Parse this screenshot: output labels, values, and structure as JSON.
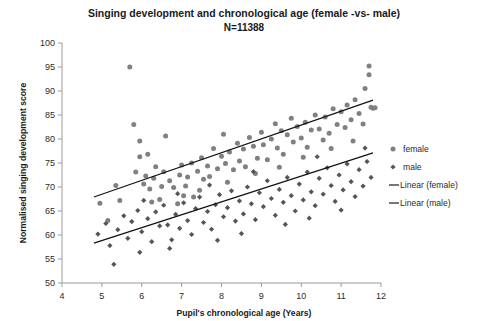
{
  "chart_data": {
    "type": "scatter",
    "title": "Singing development and chronological age (female -vs- male)",
    "subtitle": "N=11388",
    "xlabel": "Pupil's chronological age (Years)",
    "ylabel": "Normalised singing development score",
    "xlim": [
      4,
      12
    ],
    "ylim": [
      50,
      100
    ],
    "xticks": [
      4,
      5,
      6,
      7,
      8,
      9,
      10,
      11,
      12
    ],
    "yticks": [
      50,
      55,
      60,
      65,
      70,
      75,
      80,
      85,
      90,
      95,
      100
    ],
    "grid": false,
    "legend_position": "right",
    "marker_color": "#808080",
    "line_color": "#111111",
    "legend": [
      {
        "label": "female",
        "kind": "marker",
        "shape": "circle",
        "color": "#808080"
      },
      {
        "label": "male",
        "kind": "marker",
        "shape": "diamond",
        "color": "#555555"
      },
      {
        "label": "Linear (female)",
        "kind": "line",
        "color": "#111111"
      },
      {
        "label": "Linear (male)",
        "kind": "line",
        "color": "#111111"
      }
    ],
    "series": [
      {
        "name": "female",
        "shape": "circle",
        "color": "#808080",
        "points": [
          [
            4.95,
            66.6
          ],
          [
            5.15,
            63.0
          ],
          [
            5.35,
            70.3
          ],
          [
            5.45,
            67.2
          ],
          [
            5.7,
            95.0
          ],
          [
            5.8,
            83.0
          ],
          [
            5.95,
            79.6
          ],
          [
            5.95,
            76.3
          ],
          [
            6.05,
            70.6
          ],
          [
            6.1,
            72.3
          ],
          [
            6.2,
            69.6
          ],
          [
            6.3,
            71.8
          ],
          [
            6.35,
            74.2
          ],
          [
            6.45,
            67.4
          ],
          [
            6.5,
            70.1
          ],
          [
            6.55,
            73.2
          ],
          [
            6.6,
            80.6
          ],
          [
            6.7,
            71.3
          ],
          [
            6.8,
            69.9
          ],
          [
            6.95,
            72.5
          ],
          [
            7.0,
            74.6
          ],
          [
            7.1,
            70.2
          ],
          [
            7.15,
            72.1
          ],
          [
            7.25,
            75.0
          ],
          [
            7.3,
            67.9
          ],
          [
            7.4,
            73.3
          ],
          [
            7.5,
            76.1
          ],
          [
            7.55,
            71.6
          ],
          [
            7.65,
            74.4
          ],
          [
            7.7,
            72.2
          ],
          [
            7.8,
            78.0
          ],
          [
            7.9,
            73.8
          ],
          [
            8.0,
            76.4
          ],
          [
            8.05,
            81.0
          ],
          [
            8.1,
            74.9
          ],
          [
            8.2,
            77.3
          ],
          [
            8.3,
            73.6
          ],
          [
            8.4,
            79.1
          ],
          [
            8.45,
            75.4
          ],
          [
            8.55,
            77.9
          ],
          [
            8.6,
            74.2
          ],
          [
            8.7,
            80.3
          ],
          [
            8.8,
            78.5
          ],
          [
            8.9,
            76.0
          ],
          [
            9.0,
            81.4
          ],
          [
            9.05,
            78.8
          ],
          [
            9.15,
            75.7
          ],
          [
            9.25,
            80.0
          ],
          [
            9.35,
            83.2
          ],
          [
            9.4,
            78.1
          ],
          [
            9.5,
            81.7
          ],
          [
            9.55,
            76.8
          ],
          [
            9.65,
            80.9
          ],
          [
            9.75,
            84.3
          ],
          [
            9.8,
            79.4
          ],
          [
            9.9,
            82.6
          ],
          [
            10.0,
            80.2
          ],
          [
            10.1,
            83.5
          ],
          [
            10.15,
            78.3
          ],
          [
            10.25,
            81.9
          ],
          [
            10.35,
            85.0
          ],
          [
            10.45,
            82.1
          ],
          [
            10.55,
            79.8
          ],
          [
            10.6,
            84.6
          ],
          [
            10.7,
            81.2
          ],
          [
            10.8,
            86.3
          ],
          [
            10.9,
            83.0
          ],
          [
            11.0,
            85.7
          ],
          [
            11.1,
            82.4
          ],
          [
            11.15,
            87.1
          ],
          [
            11.25,
            84.0
          ],
          [
            11.35,
            88.2
          ],
          [
            11.45,
            85.3
          ],
          [
            11.55,
            83.1
          ],
          [
            11.6,
            90.5
          ],
          [
            11.7,
            95.2
          ],
          [
            11.7,
            93.4
          ],
          [
            11.75,
            86.6
          ],
          [
            11.8,
            86.4
          ],
          [
            11.85,
            86.5
          ],
          [
            5.85,
            73.1
          ],
          [
            6.15,
            76.8
          ],
          [
            6.9,
            66.5
          ],
          [
            7.45,
            69.3
          ],
          [
            8.15,
            71.0
          ],
          [
            8.85,
            72.8
          ],
          [
            9.45,
            74.1
          ],
          [
            10.05,
            76.2
          ],
          [
            10.75,
            78.0
          ],
          [
            11.3,
            79.6
          ],
          [
            6.25,
            66.9
          ],
          [
            7.05,
            68.2
          ]
        ]
      },
      {
        "name": "male",
        "shape": "diamond",
        "color": "#555555",
        "points": [
          [
            4.9,
            60.2
          ],
          [
            5.1,
            62.4
          ],
          [
            5.3,
            53.9
          ],
          [
            5.4,
            61.1
          ],
          [
            5.55,
            64.0
          ],
          [
            5.65,
            59.3
          ],
          [
            5.75,
            62.8
          ],
          [
            5.9,
            65.1
          ],
          [
            6.0,
            60.7
          ],
          [
            6.15,
            63.4
          ],
          [
            6.25,
            58.6
          ],
          [
            6.35,
            64.8
          ],
          [
            6.45,
            61.9
          ],
          [
            6.55,
            66.2
          ],
          [
            6.65,
            62.1
          ],
          [
            6.75,
            59.0
          ],
          [
            6.85,
            64.3
          ],
          [
            6.95,
            61.4
          ],
          [
            7.05,
            66.7
          ],
          [
            7.15,
            63.0
          ],
          [
            7.25,
            60.1
          ],
          [
            7.35,
            65.5
          ],
          [
            7.45,
            67.9
          ],
          [
            7.55,
            62.6
          ],
          [
            7.65,
            64.9
          ],
          [
            7.75,
            61.2
          ],
          [
            7.85,
            66.3
          ],
          [
            7.95,
            68.4
          ],
          [
            8.05,
            63.8
          ],
          [
            8.15,
            65.7
          ],
          [
            8.25,
            69.2
          ],
          [
            8.35,
            62.9
          ],
          [
            8.45,
            67.1
          ],
          [
            8.55,
            64.4
          ],
          [
            8.65,
            70.0
          ],
          [
            8.75,
            66.5
          ],
          [
            8.85,
            63.2
          ],
          [
            8.95,
            68.8
          ],
          [
            9.05,
            65.9
          ],
          [
            9.15,
            71.3
          ],
          [
            9.25,
            67.6
          ],
          [
            9.35,
            64.1
          ],
          [
            9.45,
            69.5
          ],
          [
            9.55,
            66.8
          ],
          [
            9.65,
            72.0
          ],
          [
            9.75,
            68.2
          ],
          [
            9.85,
            65.0
          ],
          [
            9.95,
            70.6
          ],
          [
            10.05,
            67.3
          ],
          [
            10.15,
            73.1
          ],
          [
            10.25,
            69.0
          ],
          [
            10.35,
            66.1
          ],
          [
            10.45,
            71.8
          ],
          [
            10.55,
            68.5
          ],
          [
            10.65,
            74.0
          ],
          [
            10.75,
            70.3
          ],
          [
            10.85,
            67.0
          ],
          [
            10.95,
            72.5
          ],
          [
            11.05,
            69.4
          ],
          [
            11.15,
            74.8
          ],
          [
            11.25,
            71.1
          ],
          [
            11.35,
            68.0
          ],
          [
            11.45,
            73.6
          ],
          [
            11.55,
            70.2
          ],
          [
            11.65,
            75.3
          ],
          [
            11.75,
            72.0
          ],
          [
            6.7,
            57.2
          ],
          [
            7.9,
            58.9
          ],
          [
            8.5,
            60.3
          ],
          [
            9.6,
            62.2
          ],
          [
            10.2,
            63.5
          ],
          [
            11.0,
            65.2
          ],
          [
            5.2,
            57.8
          ],
          [
            5.95,
            56.4
          ],
          [
            7.7,
            70.4
          ],
          [
            8.8,
            73.2
          ],
          [
            10.4,
            76.3
          ],
          [
            11.6,
            78.1
          ],
          [
            6.05,
            67.2
          ],
          [
            6.9,
            68.6
          ]
        ]
      }
    ],
    "trendlines": [
      {
        "name": "Linear (female)",
        "x0": 4.8,
        "y0": 67.9,
        "x1": 11.8,
        "y1": 88.1
      },
      {
        "name": "Linear (male)",
        "x0": 4.8,
        "y0": 58.3,
        "x1": 11.8,
        "y1": 77.1
      }
    ]
  }
}
